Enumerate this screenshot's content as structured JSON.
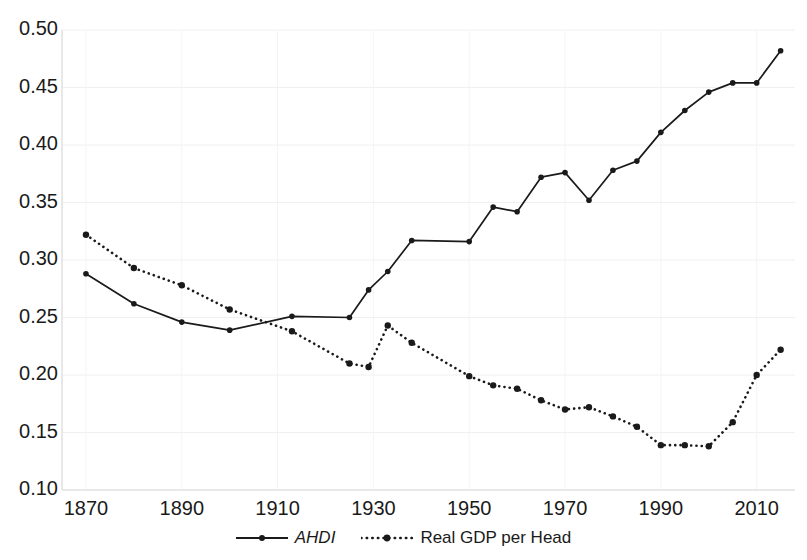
{
  "chart_data": {
    "type": "line",
    "title": "",
    "subtitle": "",
    "xlabel": "",
    "ylabel": "",
    "xlim": [
      1865,
      2018
    ],
    "ylim": [
      0.1,
      0.5
    ],
    "grid": true,
    "legend_position": "bottom-center",
    "xticks": [
      1870,
      1890,
      1910,
      1930,
      1950,
      1970,
      1990,
      2010
    ],
    "xtick_labels": [
      "1870",
      "1890",
      "1910",
      "1930",
      "1950",
      "1970",
      "1990",
      "2010"
    ],
    "yticks": [
      0.1,
      0.15,
      0.2,
      0.25,
      0.3,
      0.35,
      0.4,
      0.45,
      0.5
    ],
    "ytick_labels": [
      "0.10",
      "0.15",
      "0.20",
      "0.25",
      "0.30",
      "0.35",
      "0.40",
      "0.45",
      "0.50"
    ],
    "series": [
      {
        "name": "AHDI",
        "style": "solid",
        "marker": "circle",
        "color": "#1a1a1a",
        "x": [
          1870,
          1880,
          1890,
          1900,
          1913,
          1925,
          1929,
          1933,
          1938,
          1950,
          1955,
          1960,
          1965,
          1970,
          1975,
          1980,
          1985,
          1990,
          1995,
          2000,
          2005,
          2010,
          2015
        ],
        "values": [
          0.288,
          0.262,
          0.246,
          0.239,
          0.251,
          0.25,
          0.274,
          0.29,
          0.317,
          0.316,
          0.346,
          0.342,
          0.372,
          0.376,
          0.352,
          0.378,
          0.386,
          0.411,
          0.43,
          0.446,
          0.454,
          0.454,
          0.482
        ]
      },
      {
        "name": "Real GDP per Head",
        "style": "dotted",
        "marker": "circle",
        "color": "#1a1a1a",
        "x": [
          1870,
          1880,
          1890,
          1900,
          1913,
          1925,
          1929,
          1933,
          1938,
          1950,
          1955,
          1960,
          1965,
          1970,
          1975,
          1980,
          1985,
          1990,
          1995,
          2000,
          2005,
          2010,
          2015
        ],
        "values": [
          0.322,
          0.293,
          0.278,
          0.257,
          0.238,
          0.21,
          0.207,
          0.243,
          0.228,
          0.199,
          0.191,
          0.188,
          0.178,
          0.17,
          0.172,
          0.164,
          0.155,
          0.139,
          0.139,
          0.138,
          0.159,
          0.2,
          0.222
        ]
      }
    ]
  },
  "legend": {
    "entries": [
      {
        "label": "AHDI",
        "style": "solid"
      },
      {
        "label": "Real GDP per Head",
        "style": "dotted"
      }
    ]
  }
}
